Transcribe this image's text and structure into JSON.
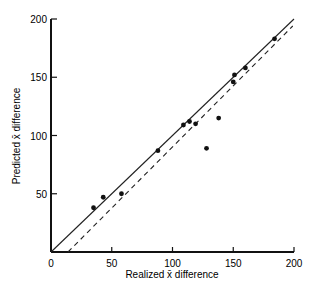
{
  "chart_data": {
    "type": "scatter",
    "title": "",
    "xlabel": "Realized x̄ difference",
    "ylabel": "Predicted x̄ difference",
    "xlim": [
      0,
      200
    ],
    "ylim": [
      0,
      200
    ],
    "xticks": [
      0,
      50,
      100,
      150,
      200
    ],
    "yticks": [
      50,
      100,
      150,
      200
    ],
    "grid": false,
    "legend": null,
    "points": [
      {
        "x": 35,
        "y": 38
      },
      {
        "x": 43,
        "y": 47
      },
      {
        "x": 58,
        "y": 50
      },
      {
        "x": 88,
        "y": 87
      },
      {
        "x": 109,
        "y": 109
      },
      {
        "x": 114,
        "y": 112
      },
      {
        "x": 119,
        "y": 110
      },
      {
        "x": 128,
        "y": 89
      },
      {
        "x": 138,
        "y": 115
      },
      {
        "x": 150,
        "y": 146
      },
      {
        "x": 151,
        "y": 152
      },
      {
        "x": 160,
        "y": 158
      },
      {
        "x": 184,
        "y": 183
      }
    ],
    "lines": [
      {
        "name": "identity (solid)",
        "style": "solid",
        "x": [
          0,
          200
        ],
        "y": [
          0,
          200
        ]
      },
      {
        "name": "fitted (dashed)",
        "style": "dashed",
        "x": [
          14,
          199
        ],
        "y": [
          0,
          194
        ]
      }
    ]
  }
}
